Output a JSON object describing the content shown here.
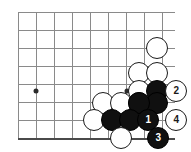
{
  "diagram": {
    "board": {
      "background_color": "#ffffff",
      "line_color": "#8a8a8a",
      "edge_color": "#4a4a4a",
      "grid_spacing_px": 18,
      "columns_x": [
        18,
        36,
        54,
        72,
        90,
        103,
        121,
        139,
        157,
        175
      ],
      "rows_y": [
        12,
        30,
        48,
        66,
        84,
        91,
        103,
        120,
        138
      ],
      "right_edge_x": 175,
      "bottom_edge_y": 138
    },
    "star_points": [
      {
        "name": "hoshi-left",
        "x": 36,
        "y": 91
      },
      {
        "name": "hoshi-right",
        "x": 127,
        "y": 91
      }
    ],
    "stones": [
      {
        "id": "w-a",
        "color": "white",
        "x": 157,
        "y": 48,
        "r": 11,
        "label": ""
      },
      {
        "id": "w-b",
        "color": "white",
        "x": 139,
        "y": 73,
        "r": 11,
        "label": ""
      },
      {
        "id": "w-c",
        "color": "white",
        "x": 157,
        "y": 73,
        "r": 11,
        "label": ""
      },
      {
        "id": "w-d",
        "color": "white",
        "x": 139,
        "y": 91,
        "r": 11,
        "label": ""
      },
      {
        "id": "b-a",
        "color": "black",
        "x": 157,
        "y": 91,
        "r": 11,
        "label": ""
      },
      {
        "id": "w-move-2",
        "color": "white",
        "x": 176,
        "y": 91,
        "r": 11,
        "label": "2"
      },
      {
        "id": "w-e",
        "color": "white",
        "x": 103,
        "y": 103,
        "r": 11,
        "label": ""
      },
      {
        "id": "w-f",
        "color": "white",
        "x": 121,
        "y": 103,
        "r": 11,
        "label": ""
      },
      {
        "id": "w-g",
        "color": "white",
        "x": 139,
        "y": 103,
        "r": 11,
        "label": ""
      },
      {
        "id": "b-b",
        "color": "black",
        "x": 157,
        "y": 103,
        "r": 11,
        "label": ""
      },
      {
        "id": "b-c",
        "color": "black",
        "x": 139,
        "y": 103,
        "r": 11,
        "label": ""
      },
      {
        "id": "w-h",
        "color": "white",
        "x": 94,
        "y": 120,
        "r": 11,
        "label": ""
      },
      {
        "id": "b-d",
        "color": "black",
        "x": 112,
        "y": 120,
        "r": 11,
        "label": ""
      },
      {
        "id": "b-e",
        "color": "black",
        "x": 130,
        "y": 120,
        "r": 11,
        "label": ""
      },
      {
        "id": "b-move-1",
        "color": "black",
        "x": 148,
        "y": 120,
        "r": 11,
        "label": "1"
      },
      {
        "id": "w-move-4",
        "color": "white",
        "x": 176,
        "y": 120,
        "r": 11,
        "label": "4"
      },
      {
        "id": "w-i",
        "color": "white",
        "x": 121,
        "y": 138,
        "r": 11,
        "label": ""
      },
      {
        "id": "b-move-3",
        "color": "black",
        "x": 158,
        "y": 138,
        "r": 11,
        "label": "3"
      }
    ],
    "move_sequence": [
      {
        "number": "1",
        "color": "black"
      },
      {
        "number": "2",
        "color": "white"
      },
      {
        "number": "3",
        "color": "black"
      },
      {
        "number": "4",
        "color": "white"
      }
    ]
  }
}
